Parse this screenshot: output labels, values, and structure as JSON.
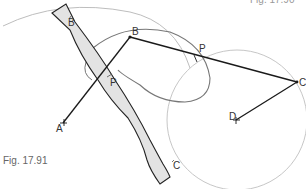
{
  "figure": {
    "caption_bottom": "Fig. 17.91",
    "caption_top_partial": "Fig. 17.90"
  },
  "labels": {
    "B_on_link": "B",
    "B_point": "B",
    "P_on_link": "P",
    "P_point": "P",
    "C_on_link": "C",
    "C_point": "C",
    "A_point": "A",
    "D_point": "D"
  },
  "colors": {
    "link_fill": "#e3e3e3",
    "link_stroke": "#222222",
    "line": "#1a1a1a",
    "locus_curve": "#777777",
    "arc": "#b5b5b5"
  }
}
